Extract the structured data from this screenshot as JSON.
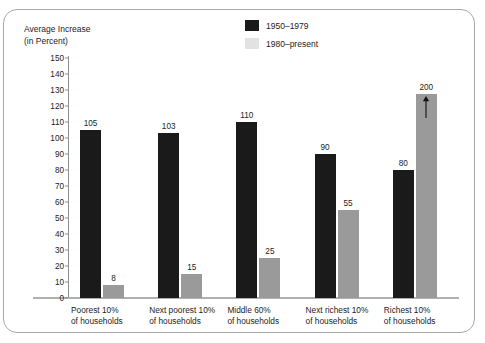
{
  "chart_data": {
    "type": "bar",
    "title": "",
    "xlabel": "",
    "ylabel": "Average Increase (in Percent)",
    "ylabel_line1": "Average Increase",
    "ylabel_line2": "(in Percent)",
    "ylim": [
      0,
      150
    ],
    "ytick_step": 10,
    "grid": false,
    "legend_position": "top-center",
    "categories": [
      "Poorest 10% of households",
      "Next poorest 10% of households",
      "Middle 60% of households",
      "Next richest 10% of households",
      "Richest 10% of households"
    ],
    "category_lines": [
      [
        "Poorest 10%",
        "of households"
      ],
      [
        "Next poorest 10%",
        "of households"
      ],
      [
        "Middle 60%",
        "of households"
      ],
      [
        "Next richest 10%",
        "of households"
      ],
      [
        "Richest 10%",
        "of households"
      ]
    ],
    "yticks": [
      0,
      10,
      20,
      30,
      40,
      50,
      60,
      70,
      80,
      90,
      100,
      110,
      120,
      130,
      140,
      150
    ],
    "series": [
      {
        "name": "1950–1979",
        "color": "#1a1a1a",
        "values": [
          105,
          103,
          110,
          90,
          80
        ],
        "labels": [
          "105",
          "103",
          "110",
          "90",
          "80"
        ]
      },
      {
        "name": "1980–present",
        "color": "#9a9a9a",
        "legend_color": "#e2e2e2",
        "values": [
          8,
          15,
          25,
          55,
          200
        ],
        "labels": [
          "8",
          "15",
          "25",
          "55",
          "200"
        ],
        "truncated_index": 4,
        "truncated_note": "bar exceeds axis maximum; drawn truncated with upward arrow"
      }
    ]
  },
  "legend": {
    "items": [
      {
        "label": "1950–1979",
        "color": "#1a1a1a"
      },
      {
        "label": "1980–present",
        "color": "#e2e2e2"
      }
    ]
  },
  "axis": {
    "title_line1": "Average Increase",
    "title_line2": "(in Percent)"
  },
  "colors": {
    "series_1950": "#1a1a1a",
    "series_1980": "#9a9a9a",
    "legend_swatch_1980": "#e2e2e2",
    "axis_line": "#8c8c8c",
    "baseline": "#b0b0b0",
    "frame_border": "#a8a8a8",
    "text": "#1c1c1c",
    "background": "#ffffff"
  }
}
